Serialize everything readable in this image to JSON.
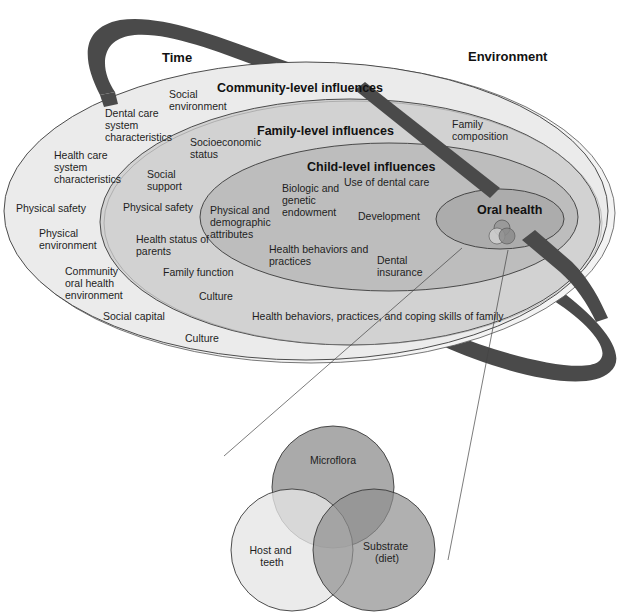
{
  "diagram": {
    "axis_labels": {
      "time": "Time",
      "environment": "Environment"
    },
    "levels": {
      "community": {
        "title": "Community-level influences",
        "fill": "#ebebeb",
        "items": {
          "social_environment": [
            "Social",
            "environment"
          ],
          "dental_care_system": [
            "Dental care",
            "system",
            "characteristics"
          ],
          "health_care_system": [
            "Health care",
            "system",
            "characteristics"
          ],
          "physical_safety": [
            "Physical safety"
          ],
          "physical_environment": [
            "Physical",
            "environment"
          ],
          "community_oral_health": [
            "Community",
            "oral health",
            "environment"
          ],
          "social_capital": [
            "Social capital"
          ],
          "culture": [
            "Culture"
          ]
        }
      },
      "family": {
        "title": "Family-level influences",
        "fill": "#d2d2d2",
        "items": {
          "socioeconomic_status": [
            "Socioeconomic",
            "status"
          ],
          "social_support": [
            "Social",
            "support"
          ],
          "physical_safety": [
            "Physical safety"
          ],
          "health_status_parents": [
            "Health status of",
            "parents"
          ],
          "family_function": [
            "Family function"
          ],
          "culture": [
            "Culture"
          ],
          "family_composition": [
            "Family",
            "composition"
          ],
          "health_behaviors_family": [
            "Health behaviors, practices, and coping skills of family"
          ]
        }
      },
      "child": {
        "title": "Child-level influences",
        "fill": "#bdbdbd",
        "items": {
          "physical_demographic": [
            "Physical and",
            "demographic",
            "attributes"
          ],
          "biologic_genetic": [
            "Biologic and",
            "genetic",
            "endowment"
          ],
          "use_of_dental_care": [
            "Use of dental care"
          ],
          "development": [
            "Development"
          ],
          "health_behaviors": [
            "Health behaviors and",
            "practices"
          ],
          "dental_insurance": [
            "Dental",
            "insurance"
          ]
        }
      },
      "oral_health": {
        "title": "Oral health",
        "fill": "#acacac"
      }
    },
    "venn": {
      "circles": [
        {
          "label": [
            "Microflora"
          ],
          "fill": "#a9a9a9"
        },
        {
          "label": [
            "Host and",
            "teeth"
          ],
          "fill": "#e3e3e3"
        },
        {
          "label": [
            "Substrate",
            "(diet)"
          ],
          "fill": "#a3a3a3"
        }
      ]
    },
    "colors": {
      "ribbon": "#4a4a4a",
      "outline": "#3a3a3a",
      "background": "#ffffff"
    }
  }
}
